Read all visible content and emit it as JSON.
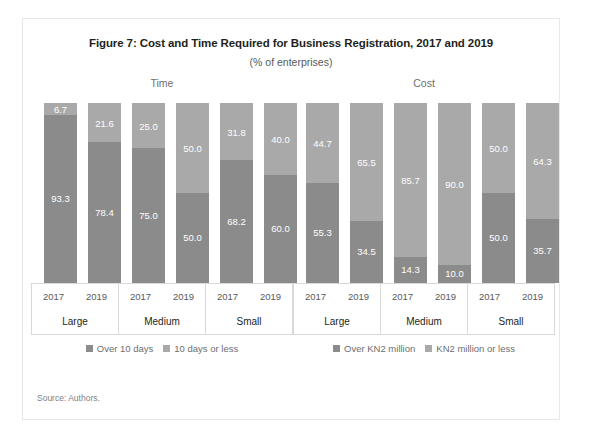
{
  "figure": {
    "title": "Figure 7: Cost and Time Required for Business Registration, 2017 and 2019",
    "subtitle": "(% of enterprises)",
    "source": "Source: Authors."
  },
  "colors": {
    "dark_gray": "#8b8b8b",
    "light_gray": "#a9a9a9",
    "label_text": "#ffffff",
    "frame": "#e8e8e8"
  },
  "panels": [
    {
      "key": "time",
      "title": "Time",
      "legend": [
        {
          "label": "Over 10 days",
          "color": "#8b8b8b"
        },
        {
          "label": "10 days or less",
          "color": "#a9a9a9"
        }
      ],
      "groups": [
        {
          "category": "Large",
          "years": [
            "2017",
            "2019"
          ]
        },
        {
          "category": "Medium",
          "years": [
            "2017",
            "2019"
          ]
        },
        {
          "category": "Small",
          "years": [
            "2017",
            "2019"
          ]
        }
      ],
      "bars": [
        {
          "group": "Large",
          "year": "2017",
          "top": 6.7,
          "bottom": 93.3,
          "top_label": "6.7",
          "bottom_label": "93.3"
        },
        {
          "group": "Large",
          "year": "2019",
          "top": 21.6,
          "bottom": 78.4,
          "top_label": "21.6",
          "bottom_label": "78.4"
        },
        {
          "group": "Medium",
          "year": "2017",
          "top": 25.0,
          "bottom": 75.0,
          "top_label": "25.0",
          "bottom_label": "75.0"
        },
        {
          "group": "Medium",
          "year": "2019",
          "top": 50.0,
          "bottom": 50.0,
          "top_label": "50.0",
          "bottom_label": "50.0"
        },
        {
          "group": "Small",
          "year": "2017",
          "top": 31.8,
          "bottom": 68.2,
          "top_label": "31.8",
          "bottom_label": "68.2"
        },
        {
          "group": "Small",
          "year": "2019",
          "top": 40.0,
          "bottom": 60.0,
          "top_label": "40.0",
          "bottom_label": "60.0"
        }
      ]
    },
    {
      "key": "cost",
      "title": "Cost",
      "legend": [
        {
          "label": "Over KN2 million",
          "color": "#8b8b8b"
        },
        {
          "label": "KN2 million or less",
          "color": "#a9a9a9"
        }
      ],
      "groups": [
        {
          "category": "Large",
          "years": [
            "2017",
            "2019"
          ]
        },
        {
          "category": "Medium",
          "years": [
            "2017",
            "2019"
          ]
        },
        {
          "category": "Small",
          "years": [
            "2017",
            "2019"
          ]
        }
      ],
      "bars": [
        {
          "group": "Large",
          "year": "2017",
          "top": 44.7,
          "bottom": 55.3,
          "top_label": "44.7",
          "bottom_label": "55.3"
        },
        {
          "group": "Large",
          "year": "2019",
          "top": 65.5,
          "bottom": 34.5,
          "top_label": "65.5",
          "bottom_label": "34.5"
        },
        {
          "group": "Medium",
          "year": "2017",
          "top": 85.7,
          "bottom": 14.3,
          "top_label": "85.7",
          "bottom_label": "14.3"
        },
        {
          "group": "Medium",
          "year": "2019",
          "top": 90.0,
          "bottom": 10.0,
          "top_label": "90.0",
          "bottom_label": "10.0"
        },
        {
          "group": "Small",
          "year": "2017",
          "top": 50.0,
          "bottom": 50.0,
          "top_label": "50.0",
          "bottom_label": "50.0"
        },
        {
          "group": "Small",
          "year": "2019",
          "top": 64.3,
          "bottom": 35.7,
          "top_label": "64.3",
          "bottom_label": "35.7"
        }
      ]
    }
  ],
  "chart_data": [
    {
      "type": "bar",
      "title": "Time",
      "subtitle": "Figure 7: Cost and Time Required for Business Registration, 2017 and 2019 (% of enterprises)",
      "stacked": true,
      "xlabel": "",
      "ylabel": "% of enterprises",
      "ylim": [
        0,
        100
      ],
      "grid": false,
      "legend_position": "bottom",
      "categories": [
        "Large 2017",
        "Large 2019",
        "Medium 2017",
        "Medium 2019",
        "Small 2017",
        "Small 2019"
      ],
      "series": [
        {
          "name": "Over 10 days",
          "values": [
            93.3,
            78.4,
            75.0,
            50.0,
            68.2,
            60.0
          ]
        },
        {
          "name": "10 days or less",
          "values": [
            6.7,
            21.6,
            25.0,
            50.0,
            31.8,
            40.0
          ]
        }
      ]
    },
    {
      "type": "bar",
      "title": "Cost",
      "subtitle": "Figure 7: Cost and Time Required for Business Registration, 2017 and 2019 (% of enterprises)",
      "stacked": true,
      "xlabel": "",
      "ylabel": "% of enterprises",
      "ylim": [
        0,
        100
      ],
      "grid": false,
      "legend_position": "bottom",
      "categories": [
        "Large 2017",
        "Large 2019",
        "Medium 2017",
        "Medium 2019",
        "Small 2017",
        "Small 2019"
      ],
      "series": [
        {
          "name": "Over KN2 million",
          "values": [
            55.3,
            34.5,
            14.3,
            10.0,
            50.0,
            35.7
          ]
        },
        {
          "name": "KN2 million or less",
          "values": [
            44.7,
            65.5,
            85.7,
            90.0,
            50.0,
            64.3
          ]
        }
      ]
    }
  ]
}
